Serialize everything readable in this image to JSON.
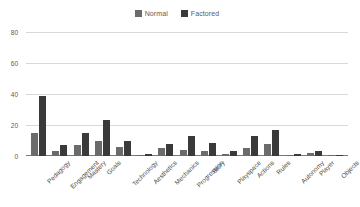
{
  "chart_data": {
    "type": "bar",
    "title": "",
    "xlabel": "",
    "ylabel": "",
    "ylim": [
      0,
      80
    ],
    "yticks": [
      "0",
      "20",
      "40",
      "60",
      "80"
    ],
    "grid": true,
    "legend_position": "top-center",
    "categories": [
      "Pedagogy",
      "Engagement",
      "Mastery",
      "Goals",
      "Technology",
      "Aesthetics",
      "Mechanics",
      "Progression",
      "Story",
      "Playspace",
      "Actions",
      "Rules",
      "Autonomy",
      "Player",
      "Objects"
    ],
    "series": [
      {
        "name": "Normal",
        "color": "#6b6b6b",
        "values": [
          15,
          3,
          7,
          10,
          6,
          0.6,
          5,
          4,
          3.5,
          1,
          5,
          8,
          0.6,
          2,
          0.3
        ]
      },
      {
        "name": "Factored",
        "color": "#3a3a3a",
        "values": [
          39,
          7,
          15,
          23,
          9.5,
          1.6,
          7.5,
          13,
          8.5,
          3,
          13,
          17,
          1.6,
          3.5,
          0.9
        ]
      }
    ]
  }
}
